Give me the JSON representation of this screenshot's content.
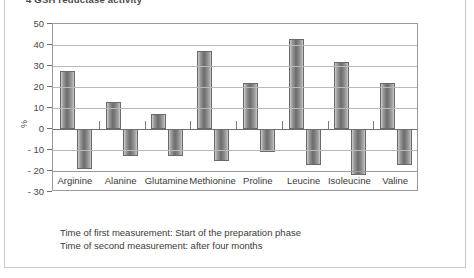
{
  "heading_clipped": "4   GSH reductase activity",
  "chart_data": {
    "type": "bar",
    "title": "",
    "xlabel": "",
    "ylabel": "%",
    "ylim": [
      -30,
      50
    ],
    "yticks": [
      50,
      40,
      30,
      20,
      10,
      0,
      -10,
      -20,
      -30
    ],
    "ytick_labels": [
      "50",
      "40",
      "30",
      "20",
      "10",
      "0",
      "- 10",
      "- 20",
      "- 30"
    ],
    "grid": true,
    "legend": "none",
    "categories": [
      "Arginine",
      "Alanine",
      "Glutamine",
      "Methionine",
      "Proline",
      "Leucine",
      "Isoleucine",
      "Valine"
    ],
    "series": [
      {
        "name": "positive change",
        "values": [
          27.5,
          13,
          7,
          37,
          22,
          43,
          32,
          22
        ]
      },
      {
        "name": "negative change",
        "values": [
          -19,
          -13,
          -13,
          -15,
          -11,
          -17,
          -22,
          -17
        ]
      }
    ]
  },
  "footnotes": [
    "Time of first measurement: Start of the preparation phase",
    "Time of second measurement: after four months"
  ]
}
